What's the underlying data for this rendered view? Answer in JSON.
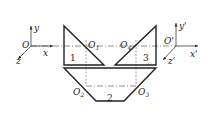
{
  "diagram": {
    "type": "projection-transformation",
    "left_frame": {
      "origin": "O",
      "axes": [
        "x",
        "y",
        "z"
      ]
    },
    "right_frame": {
      "origin": "O'",
      "axes": [
        "x'",
        "y'",
        "z'"
      ]
    },
    "points": {
      "o1": {
        "main": "O",
        "sub": "1"
      },
      "o2": {
        "main": "O",
        "sub": "2"
      },
      "o3": {
        "main": "O",
        "sub": "3"
      },
      "o4": {
        "main": "O",
        "sub": "4"
      }
    },
    "regions": {
      "r1": "1",
      "r2": "2",
      "r3": "3"
    },
    "colors": {
      "line": "#222222",
      "background": "#ffffff"
    }
  }
}
